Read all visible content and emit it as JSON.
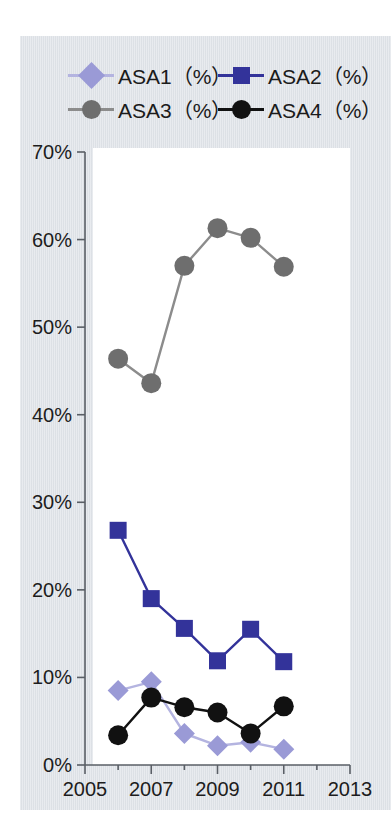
{
  "figure": {
    "background_color": "#dfe3e8",
    "plot_background_color": "#ffffff"
  },
  "legend": {
    "position": "top",
    "entries": [
      {
        "label": "ASA1（%）",
        "marker": "diamond",
        "color": "#9a9ad6",
        "line_color": "#b4b4e0"
      },
      {
        "label": "ASA2（%）",
        "marker": "square",
        "color": "#33339a",
        "line_color": "#33339a"
      },
      {
        "label": "ASA3（%）",
        "marker": "circle",
        "color": "#6e6e6e",
        "line_color": "#8c8c8c"
      },
      {
        "label": "ASA4（%）",
        "marker": "circle",
        "color": "#111111",
        "line_color": "#111111"
      }
    ]
  },
  "axes": {
    "y_ticks": [
      "0%",
      "10%",
      "20%",
      "30%",
      "40%",
      "50%",
      "60%",
      "70%"
    ],
    "y_tick_values": [
      0,
      10,
      20,
      30,
      40,
      50,
      60,
      70
    ],
    "x_ticks": [
      "2005",
      "2007",
      "2009",
      "2011",
      "2013"
    ],
    "x_tick_values": [
      2005,
      2007,
      2009,
      2011,
      2013
    ],
    "ylim": [
      0,
      70
    ],
    "xlim": [
      2005,
      2013
    ],
    "grid": false
  },
  "chart_data": {
    "type": "line",
    "title": "",
    "xlabel": "",
    "ylabel": "",
    "ylim": [
      0,
      70
    ],
    "xlim": [
      2005,
      2013
    ],
    "grid": false,
    "legend_position": "top",
    "x": [
      2006,
      2007,
      2008,
      2009,
      2010,
      2011
    ],
    "series": [
      {
        "name": "ASA1（%）",
        "marker": "diamond",
        "color": "#9a9ad6",
        "line_color": "#b4b4e0",
        "values": [
          8.5,
          9.5,
          3.6,
          2.2,
          2.6,
          1.8
        ]
      },
      {
        "name": "ASA2（%）",
        "marker": "square",
        "color": "#33339a",
        "line_color": "#33339a",
        "values": [
          26.8,
          19.0,
          15.6,
          11.9,
          15.5,
          11.8
        ]
      },
      {
        "name": "ASA3（%）",
        "marker": "circle",
        "color": "#6e6e6e",
        "line_color": "#8c8c8c",
        "values": [
          46.4,
          43.6,
          57.0,
          61.3,
          60.2,
          56.9
        ]
      },
      {
        "name": "ASA4（%）",
        "marker": "circle",
        "color": "#111111",
        "line_color": "#111111",
        "values": [
          3.4,
          7.7,
          6.6,
          6.0,
          3.6,
          6.7
        ]
      }
    ]
  }
}
